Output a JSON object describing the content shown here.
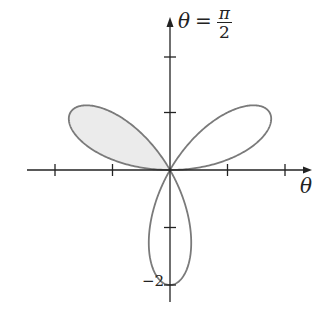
{
  "figure": {
    "type": "polar-rose",
    "equation": "r = 2 sin(3θ)",
    "y_axis_label": {
      "var": "θ",
      "eq": "=",
      "num": "π",
      "den": "2"
    },
    "x_axis_label": "θ",
    "tick_label_bottom": "−2",
    "colors": {
      "curve": "#7a7a7a",
      "fill": "#ebebeb",
      "axis": "#222222"
    },
    "origin_px": [
      170,
      170
    ],
    "unit_px": 57.5,
    "x_ticks": [
      -2,
      -1,
      1,
      2
    ],
    "y_ticks": [
      1,
      -1,
      -2
    ],
    "shaded_lobe": "lower lobe (θ from π to 4π/3)"
  }
}
